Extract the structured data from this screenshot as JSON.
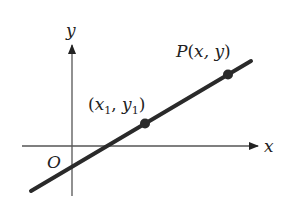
{
  "diagram": {
    "type": "coordinate-plane-line",
    "colors": {
      "background": "#ffffff",
      "axis": "#555555",
      "line": "#2a2a2a",
      "point": "#2a2a2a",
      "text": "#222222"
    },
    "axes": {
      "x_label": "x",
      "y_label": "y",
      "origin_label": "O"
    },
    "line": {
      "description": "Straight line passing through two marked points"
    },
    "points": [
      {
        "id": "p1",
        "label_open": "(",
        "x_sym": "x",
        "x_sub": "1",
        "sep": ", ",
        "y_sym": "y",
        "y_sub": "1",
        "label_close": ")"
      },
      {
        "id": "P",
        "name": "P",
        "label_open": "(",
        "coords": "x, y",
        "label_close": ")"
      }
    ]
  }
}
